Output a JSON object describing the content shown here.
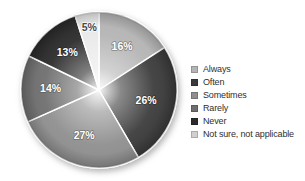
{
  "chart_data": {
    "type": "pie",
    "title": "",
    "subtitle": "",
    "xlabel": "",
    "ylabel": "",
    "legend_position": "right",
    "grid": false,
    "value_suffix": "%",
    "categories": [
      "Always",
      "Often",
      "Sometimes",
      "Rarely",
      "Never",
      "Not sure, not applicable"
    ],
    "values": [
      16,
      26,
      27,
      14,
      13,
      5
    ],
    "labels": [
      "16%",
      "26%",
      "27%",
      "14%",
      "13%",
      "5%"
    ],
    "colors": [
      "#b4b4b4",
      "#3a3a3a",
      "#8e8e8e",
      "#6e6e6e",
      "#2b2b2b",
      "#e9e9e9"
    ],
    "slices": [
      {
        "name": "Always",
        "value": 16,
        "label": "16%",
        "color": "#b4b4b4",
        "label_tone": "on-light"
      },
      {
        "name": "Often",
        "value": 26,
        "label": "26%",
        "color": "#3a3a3a",
        "label_tone": "on-dark"
      },
      {
        "name": "Sometimes",
        "value": 27,
        "label": "27%",
        "color": "#8e8e8e",
        "label_tone": "on-light"
      },
      {
        "name": "Rarely",
        "value": 14,
        "label": "14%",
        "color": "#6e6e6e",
        "label_tone": "on-light"
      },
      {
        "name": "Never",
        "value": 13,
        "label": "13%",
        "color": "#2b2b2b",
        "label_tone": "on-dark"
      },
      {
        "name": "Not sure, not applicable",
        "value": 5,
        "label": "5%",
        "color": "#e9e9e9",
        "label_tone": "on-pale"
      }
    ]
  },
  "legend": {
    "items": [
      {
        "label": "Always",
        "color": "#b4b4b4"
      },
      {
        "label": "Often",
        "color": "#3a3a3a"
      },
      {
        "label": "Sometimes",
        "color": "#8e8e8e"
      },
      {
        "label": "Rarely",
        "color": "#6e6e6e"
      },
      {
        "label": "Never",
        "color": "#2b2b2b"
      },
      {
        "label": "Not sure, not applicable",
        "color": "#d0d0d0"
      }
    ]
  }
}
